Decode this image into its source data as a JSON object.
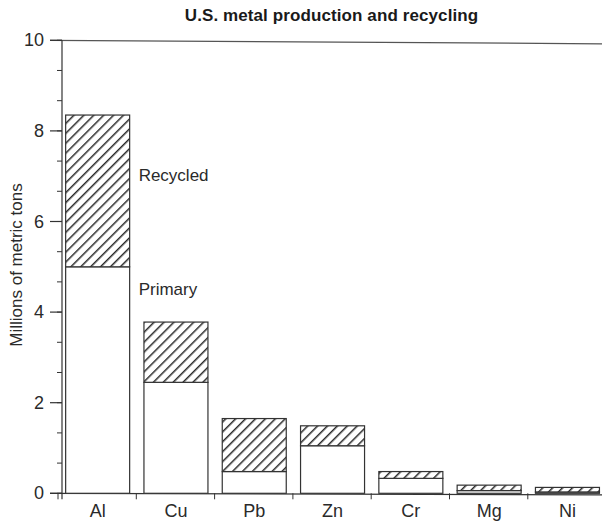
{
  "chart_data": {
    "type": "bar",
    "stacked": true,
    "title": "U.S. metal production and recycling",
    "xlabel": "",
    "ylabel": "Millions of metric tons",
    "ylim": [
      0,
      10
    ],
    "yticks_major": [
      0,
      2,
      4,
      6,
      8,
      10
    ],
    "yticks_minor_step": 0.6667,
    "grid": false,
    "categories": [
      "Al",
      "Cu",
      "Pb",
      "Zn",
      "Cr",
      "Mg",
      "Ni"
    ],
    "series": [
      {
        "name": "Primary",
        "fill": "white",
        "values": [
          5.0,
          2.45,
          0.48,
          1.05,
          0.33,
          0.06,
          0.03
        ]
      },
      {
        "name": "Recycled",
        "fill": "diagonal-hatch",
        "values": [
          3.35,
          1.33,
          1.17,
          0.44,
          0.15,
          0.12,
          0.1
        ]
      }
    ],
    "totals": [
      8.35,
      3.78,
      1.65,
      1.49,
      0.48,
      0.18,
      0.13
    ],
    "annotations": [
      {
        "text": "Recycled",
        "near": "Al",
        "segment": "Recycled"
      },
      {
        "text": "Primary",
        "near": "Al",
        "segment": "Primary"
      }
    ],
    "legend": "inline annotations next to Al bar",
    "colors": {
      "stroke": "#333333",
      "hatch": "#2a2a2a",
      "axis": "#333333",
      "top_line": "#555555",
      "background": "#ffffff"
    }
  }
}
